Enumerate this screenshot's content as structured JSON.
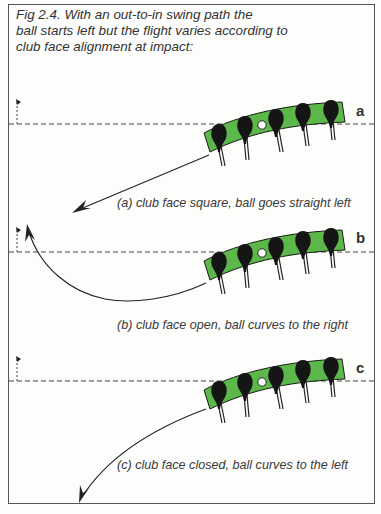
{
  "figure": {
    "title": "Fig 2.4. With an out-to-in swing path the ball starts left but the flight varies according to club face alignment at impact:",
    "title_lines": [
      "Fig 2.4. With an out-to-in swing path the",
      "ball starts left but the flight varies according to",
      "club face alignment at impact:"
    ],
    "colors": {
      "green": "#5cb84a",
      "ink": "#1a1a1a",
      "dash": "#444444",
      "background": "#fdfdfb"
    },
    "panels": [
      {
        "tag": "a",
        "caption": "(a) club face square, ball goes straight left",
        "flight": "straight-left"
      },
      {
        "tag": "b",
        "caption": "(b) club face open, ball curves to the right",
        "flight": "curve-right"
      },
      {
        "tag": "c",
        "caption": "(c) club face closed, ball curves to the left",
        "flight": "curve-left"
      }
    ]
  }
}
